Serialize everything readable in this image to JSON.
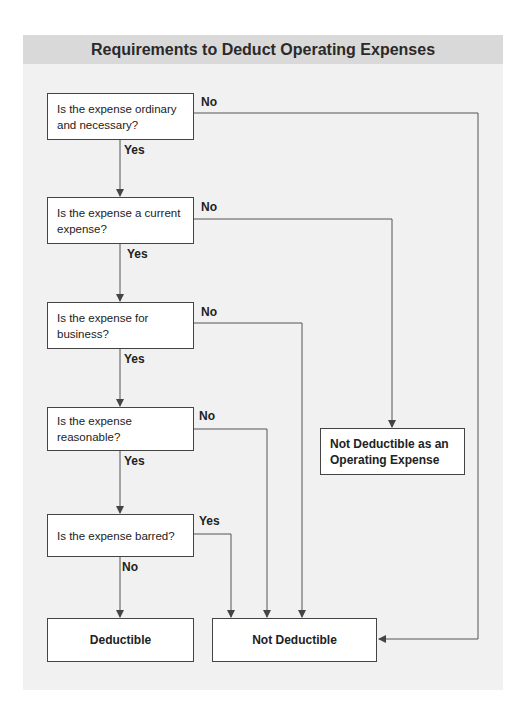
{
  "title": "Requirements to Deduct Operating Expenses",
  "questions": [
    {
      "text": "Is the expense ordinary and necessary?",
      "yes": "Yes",
      "no": "No"
    },
    {
      "text": "Is the expense a current expense?",
      "yes": "Yes",
      "no": "No"
    },
    {
      "text": "Is the expense for business?",
      "yes": "Yes",
      "no": "No"
    },
    {
      "text": "Is the expense reasonable?",
      "yes": "Yes",
      "no": "No"
    },
    {
      "text": "Is the expense barred?",
      "yes": "Yes",
      "no": "No"
    }
  ],
  "outcomes": {
    "deductible": "Deductible",
    "not_deductible": "Not Deductible",
    "not_deductible_operating": "Not Deductible as an Operating Expense"
  },
  "colors": {
    "header_bg": "#d9d9d9",
    "panel_bg": "#f1f1f1",
    "line": "#555555"
  }
}
